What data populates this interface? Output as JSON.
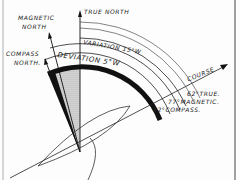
{
  "diagram": {
    "labels": {
      "magnetic_north_1": "MAGNETIC",
      "magnetic_north_2": "NORTH",
      "true_north": "TRUE NORTH",
      "compass_north_1": "COMPASS",
      "compass_north_2": "NORTH.",
      "variation": "VARIATION 15°W",
      "deviation": "DEVIATION 5°W",
      "course": "COURSE",
      "true_course": "62°TRUE.",
      "magnetic_course": "77°MAGNETIC.",
      "compass_course": "82°COMPASS."
    },
    "values": {
      "variation_deg": 15,
      "variation_dir": "W",
      "deviation_deg": 5,
      "deviation_dir": "W",
      "course_true_deg": 62,
      "course_magnetic_deg": 77,
      "course_compass_deg": 82
    },
    "colors": {
      "ink": "#1a1a1a",
      "paper": "#fdfdfd",
      "shade": "#9a9a9a"
    }
  }
}
